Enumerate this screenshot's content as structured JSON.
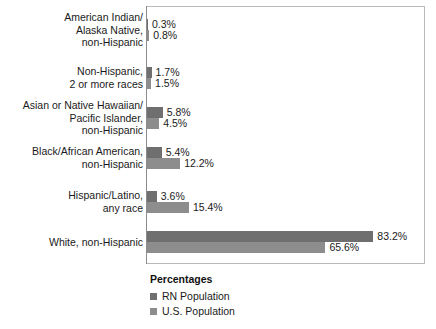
{
  "chart_data": {
    "type": "bar",
    "orientation": "horizontal",
    "title": "",
    "xlabel": "",
    "ylabel": "",
    "grid": false,
    "legend_position": "bottom-left",
    "legend_title": "Percentages",
    "axis_max_percent": 90,
    "categories": [
      "American Indian/\nAlaska Native,\nnon-Hispanic",
      "Non-Hispanic,\n2 or more races",
      "Asian or Native Hawaiian/\nPacific Islander,\nnon-Hispanic",
      "Black/African American,\nnon-Hispanic",
      "Hispanic/Latino,\nany race",
      "White, non-Hispanic"
    ],
    "series": [
      {
        "name": "RN Population",
        "color": "#6f6f6f",
        "values": [
          0.3,
          1.7,
          5.8,
          5.4,
          3.6,
          83.2
        ],
        "labels": [
          "0.3%",
          "1.7%",
          "5.8%",
          "5.4%",
          "3.6%",
          "83.2%"
        ]
      },
      {
        "name": "U.S. Population",
        "color": "#8d8d8d",
        "values": [
          0.8,
          1.5,
          4.5,
          12.2,
          15.4,
          65.6
        ],
        "labels": [
          "0.8%",
          "1.5%",
          "4.5%",
          "12.2%",
          "15.4%",
          "65.6%"
        ]
      }
    ]
  },
  "legend": {
    "title": "Percentages",
    "items": [
      {
        "label": "RN Population",
        "color": "#6f6f6f"
      },
      {
        "label": "U.S. Population",
        "color": "#8d8d8d"
      }
    ]
  },
  "layout": {
    "row_centers_y": [
      30,
      78,
      118,
      158,
      202,
      242
    ],
    "plot": {
      "left": 146,
      "top": 6,
      "width": 279,
      "height": 258
    },
    "px_per_percent": 2.72
  }
}
